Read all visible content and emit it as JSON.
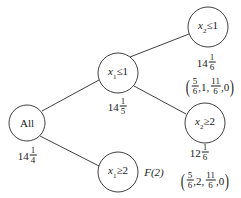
{
  "nodes": {
    "root": {
      "label": "All",
      "value_whole": "14",
      "value_num": "1",
      "value_den": "4"
    },
    "x1_le_1": {
      "var": "x",
      "sub": "1",
      "op": "≤1",
      "value_whole": "14",
      "value_num": "1",
      "value_den": "5"
    },
    "x1_ge_2": {
      "var": "x",
      "sub": "1",
      "op": "≥2",
      "note": "F(2)"
    },
    "x2_le_1": {
      "var": "x",
      "sub": "2",
      "op": "≤1",
      "value_whole": "14",
      "value_num": "1",
      "value_den": "6",
      "solution": {
        "a_num": "5",
        "a_den": "6",
        "b": "1",
        "c_num": "11",
        "c_den": "6",
        "d": "0"
      }
    },
    "x2_ge_2": {
      "var": "x",
      "sub": "2",
      "op": "≥2",
      "value_whole": "12",
      "value_num": "1",
      "value_den": "6",
      "solution": {
        "a_num": "5",
        "a_den": "6",
        "b": "2",
        "c_num": "11",
        "c_den": "6",
        "d": "0"
      }
    }
  },
  "punct": {
    "open": "(",
    "close": ")",
    "comma": ","
  },
  "colors": {
    "stroke": "#2a2a2a",
    "background": "#ffffff"
  }
}
